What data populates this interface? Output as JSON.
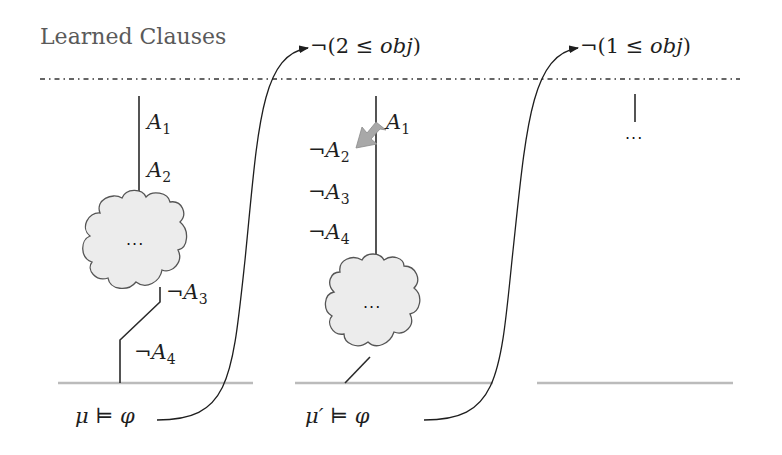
{
  "header": {
    "title": "Learned Clauses",
    "clause_1": "¬(2 ≤ obj)",
    "clause_1_neg": "¬(2 ≤ ",
    "clause_1_var": "obj",
    "clause_1_close": ")",
    "clause_2_neg": "¬(1 ≤ ",
    "clause_2_var": "obj",
    "clause_2_close": ")"
  },
  "columns": [
    {
      "labels": [
        {
          "prefix": "",
          "var": "A",
          "sub": "1"
        },
        {
          "prefix": "",
          "var": "A",
          "sub": "2"
        },
        {
          "prefix": "¬",
          "var": "A",
          "sub": "3"
        },
        {
          "prefix": "¬",
          "var": "A",
          "sub": "4"
        }
      ],
      "cloud_text": "...",
      "model_label": "μ ⊨ φ"
    },
    {
      "labels": [
        {
          "prefix": "",
          "var": "A",
          "sub": "1"
        },
        {
          "prefix": "¬",
          "var": "A",
          "sub": "2"
        },
        {
          "prefix": "¬",
          "var": "A",
          "sub": "3"
        },
        {
          "prefix": "¬",
          "var": "A",
          "sub": "4"
        }
      ],
      "cloud_text": "...",
      "model_label": "μ′ ⊨ φ"
    },
    {
      "labels": [],
      "ellipsis": "..."
    }
  ],
  "colors": {
    "line": "#2a2a2a",
    "baseline": "#b8b8b8",
    "cloud_fill": "#ececec",
    "arrow_gray": "#a8a8a8",
    "title": "#5a5a5a"
  }
}
